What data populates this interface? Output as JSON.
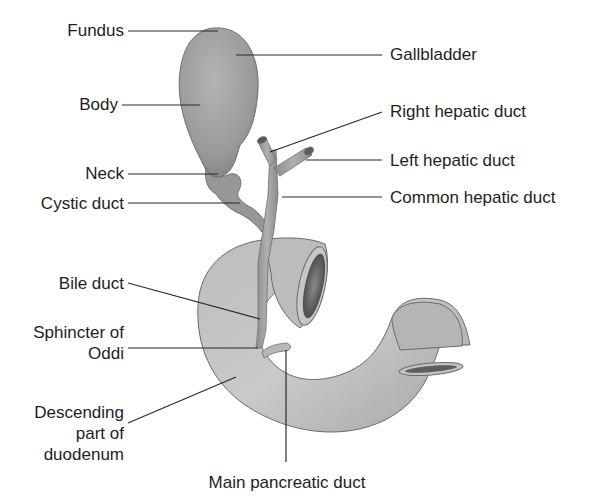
{
  "diagram": {
    "colors": {
      "organ_fill": "#a8a8a8",
      "organ_dark": "#7c7c7c",
      "organ_light": "#d2d2d2",
      "outline": "#6a6a6a",
      "leader_line": "#2a2a2a",
      "text": "#1e1e1e",
      "lumen": "#5a5a5a"
    },
    "labels": {
      "fundus": "Fundus",
      "body": "Body",
      "neck": "Neck",
      "cystic_duct": "Cystic duct",
      "gallbladder": "Gallbladder",
      "right_hepatic_duct": "Right hepatic duct",
      "left_hepatic_duct": "Left hepatic duct",
      "common_hepatic_duct": "Common hepatic duct",
      "bile_duct": "Bile duct",
      "sphincter_line1": "Sphincter of",
      "sphincter_line2": "Oddi",
      "descending_line1": "Descending",
      "descending_line2": "part of",
      "descending_line3": "duodenum",
      "main_pancreatic_duct": "Main pancreatic duct"
    }
  }
}
